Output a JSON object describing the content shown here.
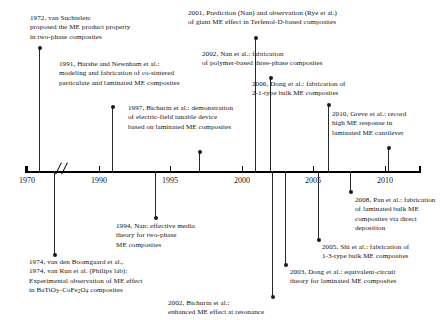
{
  "figure": {
    "axis": {
      "label": "",
      "ticks": [
        {
          "year": "1970",
          "x": 27
        },
        {
          "year": "1990",
          "x": 99
        },
        {
          "year": "1995",
          "x": 170
        },
        {
          "year": "2000",
          "x": 242
        },
        {
          "year": "2005",
          "x": 313
        },
        {
          "year": "2010",
          "x": 385
        }
      ],
      "break_symbol": "//",
      "line_color": "#000000"
    },
    "entries_above": [
      {
        "id": "e1972",
        "year": "1972",
        "text": "1972, van Suchtelen:\nproposed the ME product property\nin two-phase composites",
        "text_x": 30,
        "text_y": 14,
        "stem_x": 39,
        "stem_top": 48,
        "stem_bottom": 171
      },
      {
        "id": "e1991",
        "year": "1991",
        "text": "1991, Harshe and Newnham et al.:\nmodeling and fabrication of co-sintered\nparticulate and laminated ME composites",
        "text_x": 59,
        "text_y": 60,
        "stem_x": 112,
        "stem_top": 107,
        "stem_bottom": 171
      },
      {
        "id": "e1997",
        "year": "1997",
        "text": "1997, Bichurin et al.: demonstration\nof electric-field tunable device\nbased on laminated ME composites",
        "text_x": 128,
        "text_y": 104,
        "stem_x": 199,
        "stem_top": 152,
        "stem_bottom": 171
      },
      {
        "id": "e2001",
        "year": "2001",
        "text": "2001, Prediction (Nan) and observation (Rye et al.)\nof giant ME effect in Terfenol-D-based composites",
        "text_x": 188,
        "text_y": 9,
        "stem_x": 255,
        "stem_top": 38,
        "stem_bottom": 171
      },
      {
        "id": "e2002a",
        "year": "2002",
        "text": "2002, Nan et al.: fabrication\nof polymer-based three-phase composites",
        "text_x": 202,
        "text_y": 50,
        "stem_x": 270,
        "stem_top": 78,
        "stem_bottom": 171
      },
      {
        "id": "e2006",
        "year": "2006",
        "text": "2006, Dong et al.: fabrication of\n2-1-type bulk ME composites",
        "text_x": 252,
        "text_y": 80,
        "stem_x": 328,
        "stem_top": 105,
        "stem_bottom": 171
      },
      {
        "id": "e2010",
        "year": "2010",
        "text": "2010, Greve et al.: record\nhigh ME response in\nlaminated ME cantilever",
        "text_x": 332,
        "text_y": 110,
        "stem_x": 388,
        "stem_top": 148,
        "stem_bottom": 171
      }
    ],
    "entries_below": [
      {
        "id": "e1974",
        "year": "1974",
        "text": "1974, van den Boomgaard et al.,\n1974, van Run et al. (Philips lab):\nExperimental observation of ME effect",
        "formula_prefix": "in BaTiO",
        "formula_sub1": "3",
        "formula_mid": "–CoFe",
        "formula_sub2": "2",
        "formula_mid2": "O",
        "formula_sub3": "4",
        "formula_suffix": " composites",
        "text_x": 29,
        "text_y": 258,
        "stem_x": 54,
        "stem_top": 171,
        "stem_bottom": 255
      },
      {
        "id": "e1994",
        "year": "1994",
        "text": "1994, Nan: effective media\ntheory for two-phase\nME composites",
        "text_x": 116,
        "text_y": 222,
        "stem_x": 155,
        "stem_top": 171,
        "stem_bottom": 218
      },
      {
        "id": "e2002b",
        "year": "2002",
        "text": "2002, Bichurin et al.:\nenhanced ME effect at resonance",
        "text_x": 168,
        "text_y": 299,
        "stem_x": 272,
        "stem_top": 171,
        "stem_bottom": 297
      },
      {
        "id": "e2003",
        "year": "2003",
        "text": "2003, Dong et al.: equivalent-circuit\ntheory for laminated ME composites",
        "text_x": 290,
        "text_y": 268,
        "stem_x": 285,
        "stem_top": 171,
        "stem_bottom": 265
      },
      {
        "id": "e2005",
        "year": "2005",
        "text": "2005, Shi et al.: fabrication of\n1-3-type bulk ME composites",
        "text_x": 322,
        "text_y": 243,
        "stem_x": 318,
        "stem_top": 171,
        "stem_bottom": 240
      },
      {
        "id": "e2008",
        "year": "2008",
        "text": "2008, Pan et al.: fabrication\nof laminated bulk ME\ncomposites via direct\ndeposition",
        "text_x": 355,
        "text_y": 196,
        "stem_x": 350,
        "stem_top": 171,
        "stem_bottom": 192
      }
    ]
  }
}
